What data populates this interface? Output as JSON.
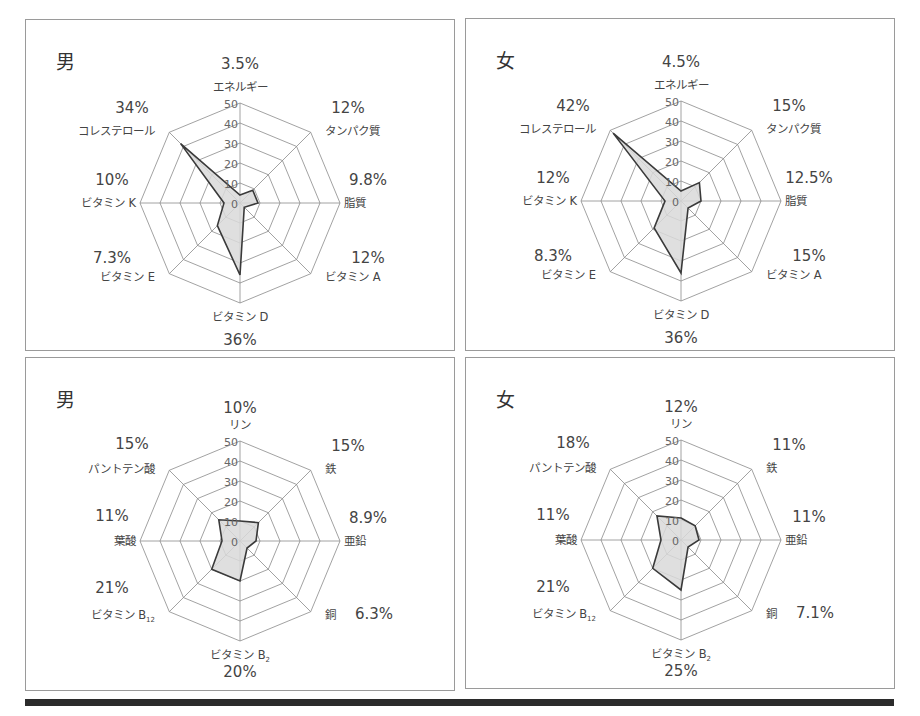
{
  "chart_data": [
    {
      "type": "radar",
      "panel": "top-left",
      "title": "男",
      "axis_range": [
        0,
        50
      ],
      "ticks": [
        0,
        10,
        20,
        30,
        40,
        50
      ],
      "axes": [
        "エネルギー",
        "タンパク質",
        "脂質",
        "ビタミンA",
        "ビタミンD",
        "ビタミンE",
        "ビタミンK",
        "コレステロール"
      ],
      "axis_percent_labels": [
        "3.5%",
        "12%",
        "9.8%",
        "12%",
        "36%",
        "7.3%",
        "10%",
        "34%"
      ],
      "values": [
        4,
        9,
        9,
        3,
        36,
        16,
        8,
        42
      ]
    },
    {
      "type": "radar",
      "panel": "top-right",
      "title": "女",
      "axis_range": [
        0,
        50
      ],
      "ticks": [
        0,
        10,
        20,
        30,
        40,
        50
      ],
      "axes": [
        "エネルギー",
        "タンパク質",
        "脂質",
        "ビタミンA",
        "ビタミンD",
        "ビタミンE",
        "ビタミンK",
        "コレステロール"
      ],
      "axis_percent_labels": [
        "4.5%",
        "15%",
        "12.5%",
        "15%",
        "36%",
        "8.3%",
        "12%",
        "42%"
      ],
      "values": [
        5,
        13,
        10,
        5,
        36,
        19,
        8,
        48
      ]
    },
    {
      "type": "radar",
      "panel": "bottom-left",
      "title": "男",
      "axis_range": [
        0,
        50
      ],
      "ticks": [
        0,
        10,
        20,
        30,
        40,
        50
      ],
      "axes": [
        "リン",
        "鉄",
        "亜鉛",
        "銅",
        "ビタミンB2",
        "ビタミンB12",
        "葉酸",
        "パントテン酸"
      ],
      "axis_percent_labels": [
        "10%",
        "15%",
        "8.9%",
        "6.3%",
        "20%",
        "21%",
        "11%",
        "15%"
      ],
      "values": [
        10,
        13,
        8,
        5,
        20,
        20,
        9,
        15
      ]
    },
    {
      "type": "radar",
      "panel": "bottom-right",
      "title": "女",
      "axis_range": [
        0,
        50
      ],
      "ticks": [
        0,
        10,
        20,
        30,
        40,
        50
      ],
      "axes": [
        "リン",
        "鉄",
        "亜鉛",
        "銅",
        "ビタミンB2",
        "ビタミンB12",
        "葉酸",
        "パントテン酸"
      ],
      "axis_percent_labels": [
        "12%",
        "11%",
        "11%",
        "7.1%",
        "25%",
        "21%",
        "11%",
        "18%"
      ],
      "values": [
        11,
        10,
        9,
        5,
        25,
        20,
        10,
        17
      ]
    }
  ],
  "panels": {
    "tl": {
      "sex": "男"
    },
    "tr": {
      "sex": "女"
    },
    "bl": {
      "sex": "男"
    },
    "br": {
      "sex": "女"
    }
  },
  "style": {
    "grid_color": "#8a8a8a",
    "series_stroke": "#3a3a3a",
    "series_fill": "#d9d9d9",
    "bar_color": "#2b2b2b"
  }
}
